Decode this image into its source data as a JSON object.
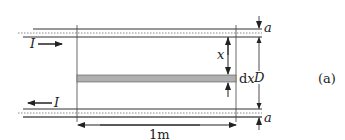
{
  "diagram": {
    "labels": {
      "current_top": "I",
      "current_bottom": "I",
      "distance_x": "x",
      "strip_width": "dx",
      "separation": "D",
      "radius_top": "a",
      "radius_bottom": "a",
      "length": "1m",
      "panel": "(a)"
    },
    "colors": {
      "line": "#333333",
      "strip_fill": "#b0b0b0",
      "dotted": "#888888"
    }
  }
}
